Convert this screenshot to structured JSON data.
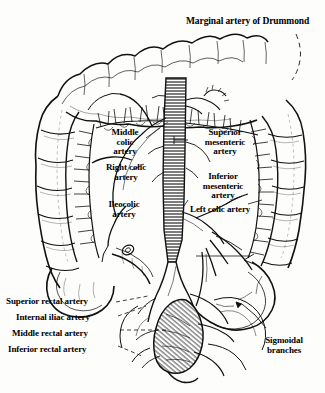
{
  "figure": {
    "background_color": "#fdfdfc",
    "ink_color": "#000000",
    "width": 325,
    "height": 393,
    "style": "black-and-white line engraving, medical anatomical illustration"
  },
  "labels": {
    "marginal_artery": "Marginal artery of Drummond",
    "middle_colic": "Middle\ncolic\nartery",
    "right_colic": "Right colic\nartery",
    "ileocolic": "Ileocolic\nartery",
    "superior_mesenteric": "Superior\nmesenteric\nartery",
    "inferior_mesenteric": "Inferior\nmesenteric\nartery",
    "left_colic": "Left colic artery",
    "superior_rectal": "Superior rectal artery",
    "internal_iliac": "Internal iliac artery",
    "middle_rectal": "Middle rectal artery",
    "inferior_rectal": "Inferior rectal artery",
    "sigmoidal": "Sigmoidal\nbranches"
  },
  "structures": [
    "transverse colon",
    "ascending colon",
    "descending colon",
    "cecum",
    "sigmoid colon",
    "rectum",
    "abdominal aorta",
    "vasa recta",
    "marginal artery arcade"
  ]
}
